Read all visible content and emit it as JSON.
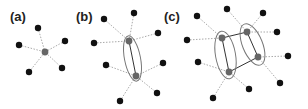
{
  "panels": [
    {
      "label": "(a)",
      "label_pos": [
        22,
        21
      ],
      "hubs": [
        [
          45,
          52
        ]
      ],
      "hub_links": [],
      "leaves": [
        {
          "pos": [
            38,
            28
          ],
          "to": 0
        },
        {
          "pos": [
            19,
            45
          ],
          "to": 0
        },
        {
          "pos": [
            65,
            41
          ],
          "to": 0
        },
        {
          "pos": [
            29,
            72
          ],
          "to": 0
        },
        {
          "pos": [
            62,
            68
          ],
          "to": 0
        }
      ],
      "groups": []
    },
    {
      "label": "(b)",
      "label_pos": [
        88,
        21
      ],
      "hubs": [
        [
          129,
          41
        ],
        [
          136,
          76
        ]
      ],
      "hub_links": [
        [
          0,
          1
        ]
      ],
      "leaves": [
        {
          "pos": [
            104,
            19
          ],
          "to": 0
        },
        {
          "pos": [
            134,
            13
          ],
          "to": 0
        },
        {
          "pos": [
            158,
            33
          ],
          "to": 0
        },
        {
          "pos": [
            94,
            43
          ],
          "to": 0
        },
        {
          "pos": [
            106,
            65
          ],
          "to": 1
        },
        {
          "pos": [
            163,
            63
          ],
          "to": 1
        },
        {
          "pos": [
            157,
            93
          ],
          "to": 1
        },
        {
          "pos": [
            120,
            101
          ],
          "to": 1
        }
      ],
      "groups": [
        {
          "cx": 132.5,
          "cy": 58.5,
          "rx": 8,
          "ry": 23,
          "rot": -11
        }
      ]
    },
    {
      "label": "(c)",
      "label_pos": [
        176,
        21
      ],
      "hubs": [
        [
          222,
          38
        ],
        [
          229,
          72
        ],
        [
          247,
          32
        ],
        [
          258,
          57
        ]
      ],
      "hub_links": [
        [
          0,
          1
        ],
        [
          2,
          3
        ],
        [
          0,
          2
        ],
        [
          1,
          3
        ]
      ],
      "leaves": [
        {
          "pos": [
            197,
            16
          ],
          "to": 0
        },
        {
          "pos": [
            187,
            40
          ],
          "to": 0
        },
        {
          "pos": [
            198,
            62
          ],
          "to": 1
        },
        {
          "pos": [
            213,
            98
          ],
          "to": 1
        },
        {
          "pos": [
            249,
            89
          ],
          "to": 1
        },
        {
          "pos": [
            227,
            9
          ],
          "to": 2
        },
        {
          "pos": [
            263,
            13
          ],
          "to": 2
        },
        {
          "pos": [
            277,
            32
          ],
          "to": 2
        },
        {
          "pos": [
            288,
            56
          ],
          "to": 3
        },
        {
          "pos": [
            280,
            83
          ],
          "to": 3
        }
      ],
      "groups": [
        {
          "cx": 225.5,
          "cy": 55,
          "rx": 10,
          "ry": 24,
          "rot": -10
        },
        {
          "cx": 252.5,
          "cy": 44.5,
          "rx": 10,
          "ry": 22,
          "rot": -22
        }
      ]
    }
  ],
  "colors": {
    "leaf": "#111111",
    "hub": "#666666",
    "dotted_edge": "#aaaaaa",
    "solid_edge": "#333333",
    "group_outline": "#777777",
    "label": "#222222"
  }
}
